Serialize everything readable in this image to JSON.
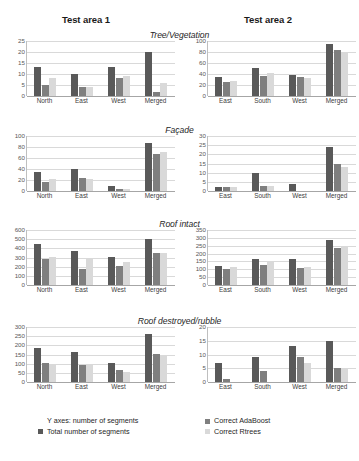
{
  "headers": {
    "area1": "Test area 1",
    "area2": "Test area 2"
  },
  "legend": {
    "y_axis_note": "Y axes: number of segments",
    "series": [
      {
        "label": "Total number of segments",
        "color": "#595959"
      },
      {
        "label": "Correct AdaBoost",
        "color": "#7f7f7f"
      },
      {
        "label": "Correct Rtrees",
        "color": "#d9d9d9"
      }
    ]
  },
  "chart_data": [
    {
      "type": "bar",
      "title": "Tree/Vegetation",
      "panel": "Test area 1",
      "xlabel": "",
      "ylabel": "number of segments",
      "ylim": [
        0,
        25
      ],
      "yticks": [
        0,
        5,
        10,
        15,
        20,
        25
      ],
      "grid": true,
      "legend_position": "bottom",
      "categories": [
        "North",
        "East",
        "West",
        "Merged"
      ],
      "series": [
        {
          "name": "Total number of segments",
          "values": [
            13,
            10,
            13,
            20
          ]
        },
        {
          "name": "Correct AdaBoost",
          "values": [
            5,
            4,
            8,
            2
          ]
        },
        {
          "name": "Correct Rtrees",
          "values": [
            8,
            4,
            9,
            6
          ]
        }
      ]
    },
    {
      "type": "bar",
      "title": "Tree/Vegetation",
      "panel": "Test area 2",
      "xlabel": "",
      "ylabel": "number of segments",
      "ylim": [
        0,
        100
      ],
      "yticks": [
        0,
        20,
        40,
        60,
        80,
        100
      ],
      "grid": true,
      "legend_position": "bottom",
      "categories": [
        "East",
        "South",
        "West",
        "Merged"
      ],
      "series": [
        {
          "name": "Total number of segments",
          "values": [
            35,
            51,
            39,
            94
          ]
        },
        {
          "name": "Correct AdaBoost",
          "values": [
            25,
            37,
            34,
            83
          ]
        },
        {
          "name": "Correct Rtrees",
          "values": [
            28,
            41,
            32,
            78
          ]
        }
      ]
    },
    {
      "type": "bar",
      "title": "Façade",
      "panel": "Test area 1",
      "xlabel": "",
      "ylabel": "number of segments",
      "ylim": [
        0,
        100
      ],
      "yticks": [
        0,
        20,
        40,
        60,
        80,
        100
      ],
      "grid": true,
      "legend_position": "bottom",
      "categories": [
        "North",
        "East",
        "West",
        "Merged"
      ],
      "series": [
        {
          "name": "Total number of segments",
          "values": [
            34,
            40,
            10,
            88
          ]
        },
        {
          "name": "Correct AdaBoost",
          "values": [
            17,
            23,
            4,
            67
          ]
        },
        {
          "name": "Correct Rtrees",
          "values": [
            21,
            21,
            4,
            71
          ]
        }
      ]
    },
    {
      "type": "bar",
      "title": "Façade",
      "panel": "Test area 2",
      "xlabel": "",
      "ylabel": "number of segments",
      "ylim": [
        0,
        30
      ],
      "yticks": [
        0,
        5,
        10,
        15,
        20,
        25,
        30
      ],
      "grid": true,
      "legend_position": "bottom",
      "categories": [
        "East",
        "South",
        "West",
        "Merged"
      ],
      "series": [
        {
          "name": "Total number of segments",
          "values": [
            2,
            10,
            4,
            24
          ]
        },
        {
          "name": "Correct AdaBoost",
          "values": [
            2,
            3,
            0,
            15
          ]
        },
        {
          "name": "Correct Rtrees",
          "values": [
            2,
            3,
            0,
            13
          ]
        }
      ]
    },
    {
      "type": "bar",
      "title": "Roof intact",
      "panel": "Test area 1",
      "xlabel": "",
      "ylabel": "number of segments",
      "ylim": [
        0,
        600
      ],
      "yticks": [
        0,
        100,
        200,
        300,
        400,
        500,
        600
      ],
      "grid": true,
      "legend_position": "bottom",
      "categories": [
        "North",
        "East",
        "West",
        "Merged"
      ],
      "series": [
        {
          "name": "Total number of segments",
          "values": [
            445,
            375,
            310,
            505
          ]
        },
        {
          "name": "Correct AdaBoost",
          "values": [
            280,
            180,
            212,
            350
          ]
        },
        {
          "name": "Correct Rtrees",
          "values": [
            308,
            295,
            250,
            350
          ]
        }
      ]
    },
    {
      "type": "bar",
      "title": "Roof intact",
      "panel": "Test area 2",
      "xlabel": "",
      "ylabel": "number of segments",
      "ylim": [
        0,
        350
      ],
      "yticks": [
        0,
        50,
        100,
        150,
        200,
        250,
        300,
        350
      ],
      "grid": true,
      "legend_position": "bottom",
      "categories": [
        "East",
        "South",
        "West",
        "Merged"
      ],
      "series": [
        {
          "name": "Total number of segments",
          "values": [
            120,
            163,
            167,
            288
          ]
        },
        {
          "name": "Correct AdaBoost",
          "values": [
            105,
            125,
            108,
            237
          ]
        },
        {
          "name": "Correct Rtrees",
          "values": [
            117,
            147,
            115,
            245
          ]
        }
      ]
    },
    {
      "type": "bar",
      "title": "Roof destroyed/rubble",
      "panel": "Test area 1",
      "xlabel": "",
      "ylabel": "number of segments",
      "ylim": [
        0,
        300
      ],
      "yticks": [
        0,
        50,
        100,
        150,
        200,
        250,
        300
      ],
      "grid": true,
      "legend_position": "bottom",
      "categories": [
        "North",
        "East",
        "West",
        "Merged"
      ],
      "series": [
        {
          "name": "Total number of segments",
          "values": [
            183,
            165,
            103,
            260
          ]
        },
        {
          "name": "Correct AdaBoost",
          "values": [
            103,
            95,
            63,
            152
          ]
        },
        {
          "name": "Correct Rtrees",
          "values": [
            93,
            98,
            52,
            150
          ]
        }
      ]
    },
    {
      "type": "bar",
      "title": "Roof destroyed/rubble",
      "panel": "Test area 2",
      "xlabel": "",
      "ylabel": "number of segments",
      "ylim": [
        0,
        20
      ],
      "yticks": [
        0,
        5,
        10,
        15,
        20
      ],
      "grid": true,
      "legend_position": "bottom",
      "categories": [
        "East",
        "South",
        "West",
        "Merged"
      ],
      "series": [
        {
          "name": "Total number of segments",
          "values": [
            7,
            9,
            13,
            15
          ]
        },
        {
          "name": "Correct AdaBoost",
          "values": [
            1,
            4,
            9,
            5
          ]
        },
        {
          "name": "Correct Rtrees",
          "values": [
            0,
            0,
            7,
            5
          ]
        }
      ]
    }
  ]
}
